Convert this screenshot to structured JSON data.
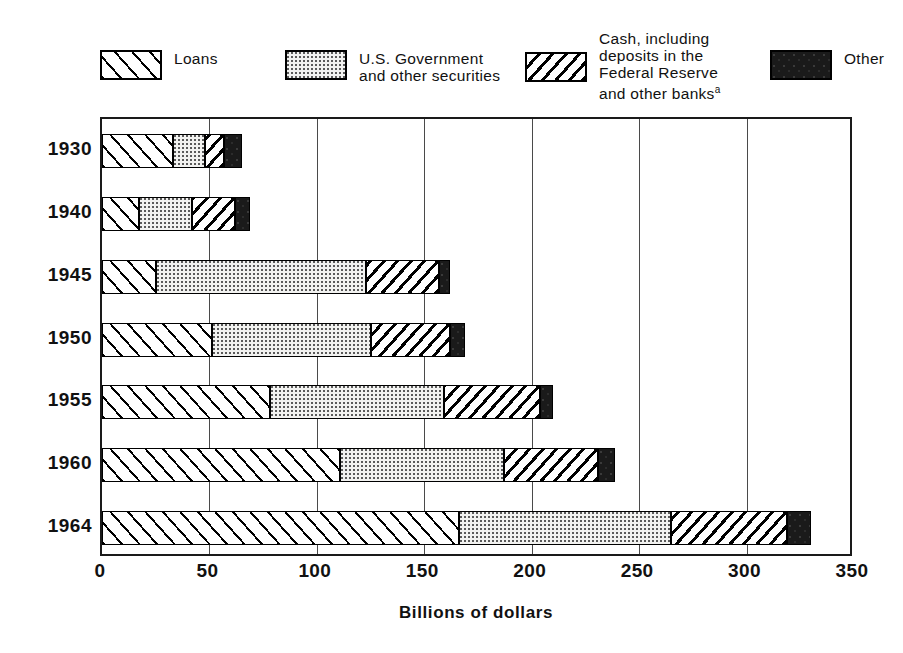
{
  "legend": {
    "entries": [
      {
        "key": "loans",
        "label": "Loans",
        "pattern": "diagonal-hatch-forward"
      },
      {
        "key": "securities",
        "label": "U.S. Government\nand other securities",
        "pattern": "stippled-dots"
      },
      {
        "key": "cash",
        "label": "Cash, including\ndeposits in the\nFederal Reserve\nand other banks",
        "footnote": "a",
        "pattern": "diagonal-hatch-back"
      },
      {
        "key": "other",
        "label": "Other",
        "pattern": "solid-black"
      }
    ]
  },
  "axis": {
    "x_title": "Billions of dollars",
    "x_ticks": [
      "0",
      "50",
      "100",
      "150",
      "200",
      "250",
      "300",
      "350"
    ],
    "x_min": 0,
    "x_max": 350,
    "x_step": 50
  },
  "chart_data": {
    "type": "bar",
    "orientation": "horizontal",
    "stacked": true,
    "title": "",
    "xlabel": "Billions of dollars",
    "ylabel": "",
    "xlim": [
      0,
      350
    ],
    "grid": true,
    "legend_position": "top",
    "categories": [
      "1930",
      "1940",
      "1945",
      "1950",
      "1955",
      "1960",
      "1964"
    ],
    "series": [
      {
        "name": "Loans",
        "values": [
          33,
          17,
          25,
          51,
          78,
          111,
          166
        ]
      },
      {
        "name": "U.S. Government and other securities",
        "values": [
          15,
          25,
          98,
          74,
          81,
          76,
          99
        ]
      },
      {
        "name": "Cash, including deposits in the Federal Reserve and other banks",
        "values": [
          9,
          20,
          34,
          37,
          45,
          44,
          54
        ]
      },
      {
        "name": "Other",
        "values": [
          8,
          7,
          5,
          7,
          6,
          8,
          11
        ]
      }
    ],
    "totals": [
      65,
      69,
      162,
      169,
      210,
      239,
      330
    ]
  },
  "colors": {
    "ink": "#000000",
    "grid": "#4a4a4a",
    "securities_fill": "#f2f2f0",
    "other_fill": "#1a1a1a",
    "background": "#ffffff"
  }
}
